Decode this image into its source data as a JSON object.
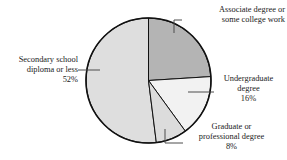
{
  "chart_data": {
    "type": "pie",
    "title": "",
    "subtitle": "",
    "xlabel": "",
    "ylabel": "",
    "legend_position": "none",
    "grid": false,
    "start_angle_deg": 0,
    "direction": "clockwise",
    "units": "percent",
    "categories": [
      "Associate degree or some college work",
      "Undergraduate degree",
      "Graduate or professional degree",
      "Secondary school diploma or less"
    ],
    "values": [
      24,
      16,
      8,
      52
    ],
    "slices": [
      {
        "label_line1": "Associate degree or",
        "label_line2": "some college work",
        "label_line3": "",
        "value": 24,
        "value_text": "",
        "color": "#b4b4b4",
        "start_deg": 0,
        "end_deg": 90
      },
      {
        "label_line1": "Undergraduate",
        "label_line2": "degree",
        "label_line3": "16%",
        "value": 16,
        "value_text": "16%",
        "color": "#f2f2f2",
        "start_deg": 90,
        "end_deg": 147.6
      },
      {
        "label_line1": "Graduate or",
        "label_line2": "professional degree",
        "label_line3": "8%",
        "value": 8,
        "value_text": "8%",
        "color": "#dcdcdc",
        "start_deg": 147.6,
        "end_deg": 176.4
      },
      {
        "label_line1": "Secondary school",
        "label_line2": "diploma or less",
        "label_line3": "52%",
        "value": 52,
        "value_text": "52%",
        "color": "#dedede",
        "start_deg": 176.4,
        "end_deg": 360
      }
    ],
    "outline_color": "#111111",
    "leader_line_color": "#4d4d4d",
    "background": "#ffffff"
  }
}
